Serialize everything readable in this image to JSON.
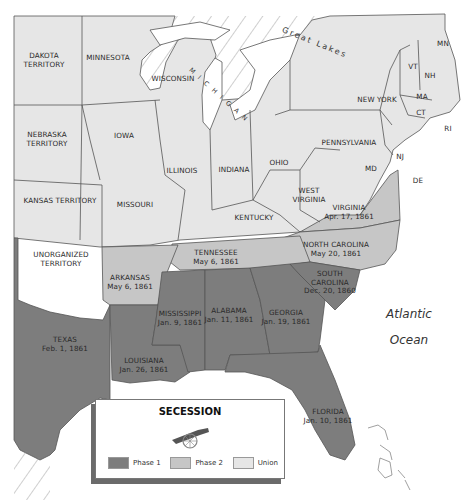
{
  "colors": {
    "phase1": "#7d7d7d",
    "phase2": "#c6c6c6",
    "union": "#e6e6e6",
    "water": "#ffffff",
    "border": "#555555"
  },
  "labels": {
    "dakota": "DAKOTA",
    "dakota2": "TERRITORY",
    "minnesota": "MINNESOTA",
    "wisconsin": "WISCONSIN",
    "michigan": "M I C H I G A N",
    "great_lakes": "Great Lakes",
    "nebraska": "NEBRASKA",
    "nebraska2": "TERRITORY",
    "iowa": "IOWA",
    "illinois": "ILLINOIS",
    "indiana": "INDIANA",
    "ohio": "OHIO",
    "pennsylvania": "PENNSYLVANIA",
    "new_york": "NEW YORK",
    "vt": "VT",
    "nh": "NH",
    "mn": "MN",
    "ma": "MA",
    "ct": "CT",
    "ri": "RI",
    "nj": "NJ",
    "md": "MD",
    "de": "DE",
    "kansas": "KANSAS TERRITORY",
    "missouri": "MISSOURI",
    "kentucky": "KENTUCKY",
    "west_virginia": "WEST",
    "west_virginia2": "VIRGINIA",
    "unorganized": "UNORGANIZED",
    "unorganized2": "TERRITORY"
  },
  "seceded": {
    "virginia": {
      "name": "VIRGINIA",
      "date": "Apr. 17, 1861"
    },
    "north_carolina": {
      "name": "NORTH CAROLINA",
      "date": "May 20, 1861"
    },
    "tennessee": {
      "name": "TENNESSEE",
      "date": "May 6, 1861"
    },
    "arkansas": {
      "name": "ARKANSAS",
      "date": "May 6, 1861"
    },
    "south_carolina": {
      "name": "SOUTH",
      "name2": "CAROLINA",
      "date": "Dec. 20, 1860"
    },
    "mississippi": {
      "name": "MISSISSIPPI",
      "date": "Jan. 9, 1861"
    },
    "alabama": {
      "name": "ALABAMA",
      "date": "Jan. 11, 1861"
    },
    "georgia": {
      "name": "GEORGIA",
      "date": "Jan. 19, 1861"
    },
    "texas": {
      "name": "TEXAS",
      "date": "Feb. 1, 1861"
    },
    "louisiana": {
      "name": "LOUISIANA",
      "date": "Jan. 26, 1861"
    },
    "florida": {
      "name": "FLORIDA",
      "date": "Jan. 10, 1861"
    }
  },
  "ocean": {
    "line1": "Atlantic",
    "line2": "Ocean"
  },
  "legend": {
    "title": "SECESSION",
    "icon": "cannon-icon",
    "items": [
      {
        "label": "Phase 1",
        "color": "#7d7d7d"
      },
      {
        "label": "Phase 2",
        "color": "#c6c6c6"
      },
      {
        "label": "Union",
        "color": "#e6e6e6"
      }
    ]
  }
}
